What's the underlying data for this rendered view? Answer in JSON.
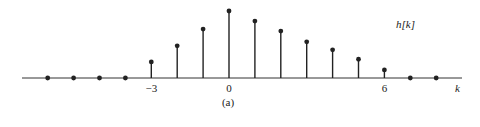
{
  "chart_data": {
    "type": "stem",
    "title": "",
    "series_label": "h[k]",
    "xlabel": "k",
    "ylabel": "",
    "caption": "(a)",
    "x": [
      -7,
      -6,
      -5,
      -4,
      -3,
      -2,
      -1,
      0,
      1,
      2,
      3,
      4,
      5,
      6,
      7,
      8
    ],
    "values": [
      0,
      0,
      0,
      0,
      0.24,
      0.48,
      0.73,
      1.0,
      0.85,
      0.7,
      0.54,
      0.42,
      0.28,
      0.12,
      0,
      0
    ],
    "x_tick_labels": [
      {
        "k": -3,
        "label": "−3"
      },
      {
        "k": 0,
        "label": "0"
      },
      {
        "k": 6,
        "label": "6"
      }
    ],
    "grid": false,
    "colors": {
      "stem": "#222222",
      "axis": "#333333"
    }
  }
}
